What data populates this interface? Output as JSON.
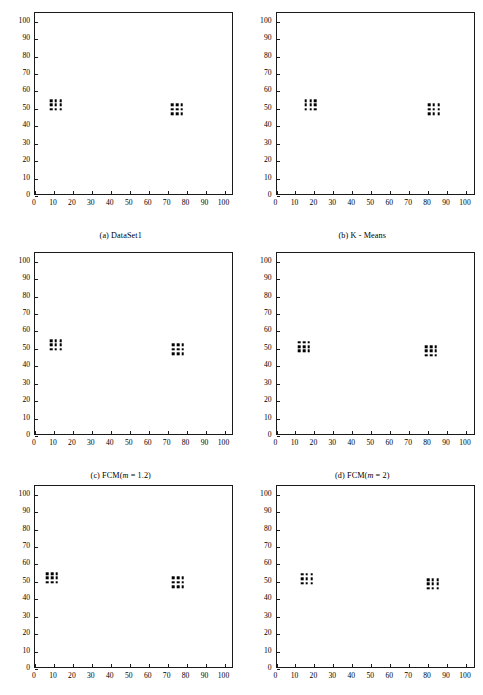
{
  "figure": {
    "panel_count": 6,
    "axis": {
      "xlabel": "",
      "ylabel": "",
      "xlim": [
        0,
        105
      ],
      "ylim": [
        0,
        105
      ],
      "xticks": [
        0,
        10,
        20,
        30,
        40,
        50,
        60,
        70,
        80,
        90,
        100
      ],
      "yticks": [
        0,
        10,
        20,
        30,
        40,
        50,
        60,
        70,
        80,
        90,
        100
      ],
      "grid": false
    },
    "marker_color": "#000000",
    "axis_color": "#1a1a1a"
  },
  "chart_data": [
    {
      "type": "scatter",
      "panel_id": "a",
      "title": "(a) DataSet1",
      "caption_prefix": "(a) ",
      "caption_main": "DataSet1",
      "caption_italic": "",
      "caption_suffix": "",
      "xlabel": "",
      "ylabel": "",
      "xlim": [
        0,
        105
      ],
      "ylim": [
        0,
        105
      ],
      "xticks": [
        0,
        10,
        20,
        30,
        40,
        50,
        60,
        70,
        80,
        90,
        100
      ],
      "yticks": [
        0,
        10,
        20,
        30,
        40,
        50,
        60,
        70,
        80,
        90,
        100
      ],
      "grid": false,
      "legend": null,
      "series": [
        {
          "name": "cluster-left",
          "x": [
            8.5,
            11.0,
            13.5,
            8.5,
            11.0,
            13.5,
            8.5,
            11.0,
            13.5
          ],
          "y": [
            55.5,
            55.5,
            55.5,
            53.0,
            53.0,
            53.0,
            50.5,
            50.5,
            50.5
          ]
        },
        {
          "name": "cluster-right",
          "x": [
            72.5,
            75.0,
            77.5,
            72.5,
            75.0,
            77.5,
            72.5,
            75.0,
            77.5
          ],
          "y": [
            53.0,
            53.0,
            53.0,
            50.5,
            50.5,
            50.5,
            48.0,
            48.0,
            48.0
          ]
        }
      ]
    },
    {
      "type": "scatter",
      "panel_id": "b",
      "title": "(b) K - Means",
      "caption_prefix": "(b) ",
      "caption_main": "K - Means",
      "caption_italic": "",
      "caption_suffix": "",
      "xlabel": "",
      "ylabel": "",
      "xlim": [
        0,
        105
      ],
      "ylim": [
        0,
        105
      ],
      "xticks": [
        0,
        10,
        20,
        30,
        40,
        50,
        60,
        70,
        80,
        90,
        100
      ],
      "yticks": [
        0,
        10,
        20,
        30,
        40,
        50,
        60,
        70,
        80,
        90,
        100
      ],
      "grid": false,
      "legend": null,
      "series": [
        {
          "name": "cluster-left",
          "x": [
            15.5,
            18.0,
            20.5,
            15.5,
            18.0,
            20.5,
            15.5,
            18.0,
            20.5
          ],
          "y": [
            55.5,
            55.5,
            55.5,
            53.0,
            53.0,
            53.0,
            50.5,
            50.5,
            50.5
          ]
        },
        {
          "name": "cluster-right",
          "x": [
            80.5,
            83.0,
            85.5,
            80.5,
            83.0,
            85.5,
            80.5,
            83.0,
            85.5
          ],
          "y": [
            53.0,
            53.0,
            53.0,
            50.5,
            50.5,
            50.5,
            48.0,
            48.0,
            48.0
          ]
        }
      ]
    },
    {
      "type": "scatter",
      "panel_id": "c",
      "title": "(c) FCM(m = 1.2)",
      "caption_prefix": "(c) FCM(",
      "caption_main": "",
      "caption_italic": "m",
      "caption_suffix": " = 1.2)",
      "xlabel": "",
      "ylabel": "",
      "xlim": [
        0,
        105
      ],
      "ylim": [
        0,
        105
      ],
      "xticks": [
        0,
        10,
        20,
        30,
        40,
        50,
        60,
        70,
        80,
        90,
        100
      ],
      "yticks": [
        0,
        10,
        20,
        30,
        40,
        50,
        60,
        70,
        80,
        90,
        100
      ],
      "grid": false,
      "legend": null,
      "series": [
        {
          "name": "cluster-left",
          "x": [
            8.5,
            11.0,
            13.5,
            8.5,
            11.0,
            13.5,
            8.5,
            11.0,
            13.5
          ],
          "y": [
            55.5,
            55.5,
            55.5,
            53.0,
            53.0,
            53.0,
            50.5,
            50.5,
            50.5
          ]
        },
        {
          "name": "cluster-right",
          "x": [
            73.0,
            75.5,
            78.0,
            73.0,
            75.5,
            78.0,
            73.0,
            75.5,
            78.0
          ],
          "y": [
            53.0,
            53.0,
            53.0,
            50.5,
            50.5,
            50.5,
            48.0,
            48.0,
            48.0
          ]
        }
      ]
    },
    {
      "type": "scatter",
      "panel_id": "d",
      "title": "(d) FCM(m = 2)",
      "caption_prefix": "(d) FCM(",
      "caption_main": "",
      "caption_italic": "m",
      "caption_suffix": " = 2)",
      "xlabel": "",
      "ylabel": "",
      "xlim": [
        0,
        105
      ],
      "ylim": [
        0,
        105
      ],
      "xticks": [
        0,
        10,
        20,
        30,
        40,
        50,
        60,
        70,
        80,
        90,
        100
      ],
      "yticks": [
        0,
        10,
        20,
        30,
        40,
        50,
        60,
        70,
        80,
        90,
        100
      ],
      "grid": false,
      "legend": null,
      "series": [
        {
          "name": "cluster-left",
          "x": [
            12.0,
            14.5,
            17.0,
            12.0,
            14.5,
            17.0,
            12.0,
            14.5,
            17.0
          ],
          "y": [
            54.5,
            54.5,
            54.5,
            52.0,
            52.0,
            52.0,
            49.5,
            49.5,
            49.5
          ]
        },
        {
          "name": "cluster-right",
          "x": [
            79.0,
            81.5,
            84.0,
            79.0,
            81.5,
            84.0,
            79.0,
            81.5,
            84.0
          ],
          "y": [
            52.0,
            52.0,
            52.0,
            49.5,
            49.5,
            49.5,
            47.0,
            47.0,
            47.0
          ]
        }
      ]
    },
    {
      "type": "scatter",
      "panel_id": "e",
      "title": "(e) FCM(m = 5)",
      "caption_prefix": "(e) FCM(",
      "caption_main": "",
      "caption_italic": "m",
      "caption_suffix": " = 5)",
      "xlabel": "",
      "ylabel": "",
      "xlim": [
        0,
        105
      ],
      "ylim": [
        0,
        105
      ],
      "xticks": [
        0,
        10,
        20,
        30,
        40,
        50,
        60,
        70,
        80,
        90,
        100
      ],
      "yticks": [
        0,
        10,
        20,
        30,
        40,
        50,
        60,
        70,
        80,
        90,
        100
      ],
      "grid": false,
      "legend": null,
      "series": [
        {
          "name": "cluster-left",
          "x": [
            6.5,
            9.0,
            11.5,
            6.5,
            9.0,
            11.5,
            6.5,
            9.0,
            11.5
          ],
          "y": [
            55.5,
            55.5,
            55.5,
            53.0,
            53.0,
            53.0,
            50.5,
            50.5,
            50.5
          ]
        },
        {
          "name": "cluster-right",
          "x": [
            73.0,
            75.5,
            78.0,
            73.0,
            75.5,
            78.0,
            73.0,
            75.5,
            78.0
          ],
          "y": [
            53.0,
            53.0,
            53.0,
            50.5,
            50.5,
            50.5,
            48.0,
            48.0,
            48.0
          ]
        }
      ]
    },
    {
      "type": "scatter",
      "panel_id": "f",
      "title": "(f) FCM(m = 10)",
      "caption_prefix": "(f) FCM(",
      "caption_main": "",
      "caption_italic": "m",
      "caption_suffix": " = 10)",
      "xlabel": "",
      "ylabel": "",
      "xlim": [
        0,
        105
      ],
      "ylim": [
        0,
        105
      ],
      "xticks": [
        0,
        10,
        20,
        30,
        40,
        50,
        60,
        70,
        80,
        90,
        100
      ],
      "yticks": [
        0,
        10,
        20,
        30,
        40,
        50,
        60,
        70,
        80,
        90,
        100
      ],
      "grid": false,
      "legend": null,
      "series": [
        {
          "name": "cluster-left",
          "x": [
            13.5,
            16.0,
            18.5,
            13.5,
            16.0,
            18.5,
            13.5,
            16.0,
            18.5
          ],
          "y": [
            55.0,
            55.0,
            55.0,
            52.5,
            52.5,
            52.5,
            50.0,
            50.0,
            50.0
          ]
        },
        {
          "name": "cluster-right",
          "x": [
            80.0,
            82.5,
            85.0,
            80.0,
            82.5,
            85.0,
            80.0,
            82.5,
            85.0
          ],
          "y": [
            52.0,
            52.0,
            52.0,
            49.5,
            49.5,
            49.5,
            47.0,
            47.0,
            47.0
          ]
        }
      ]
    }
  ]
}
